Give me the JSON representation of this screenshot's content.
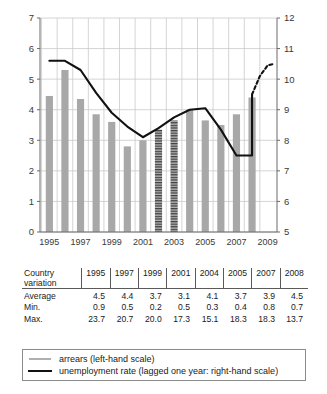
{
  "chart_data": {
    "type": "bar",
    "title": "",
    "subtitle": "",
    "xlabel": "",
    "ylabel": "",
    "grid": true,
    "legend_position": "below-table",
    "x": [
      1995,
      1996,
      1997,
      1998,
      1999,
      2000,
      2001,
      2002,
      2003,
      2004,
      2005,
      2006,
      2007,
      2008
    ],
    "categories": [
      "1995",
      "1996",
      "1997",
      "1998",
      "1999",
      "2000",
      "2001",
      "2002",
      "2003",
      "2004",
      "2005",
      "2006",
      "2007",
      "2008"
    ],
    "xtick_labels": [
      "1995",
      "1997",
      "1999",
      "2001",
      "2003",
      "2005",
      "2007",
      "2009"
    ],
    "xtick_values": [
      1995,
      1997,
      1999,
      2001,
      2003,
      2005,
      2007,
      2009
    ],
    "xlim": [
      1994.4,
      2009.6
    ],
    "left_axis": {
      "label": "arrears (left-hand scale)",
      "ylim": [
        0,
        7
      ],
      "ticks": [
        0,
        1,
        2,
        3,
        4,
        5,
        6,
        7
      ],
      "tick_labels": [
        "0",
        "1",
        "2",
        "3",
        "4",
        "5",
        "6",
        "7"
      ]
    },
    "right_axis": {
      "label": "unemployment rate (lagged one year: right-hand scale)",
      "ylim": [
        5,
        12
      ],
      "ticks": [
        5,
        6,
        7,
        8,
        9,
        10,
        11,
        12
      ],
      "tick_labels": [
        "5",
        "6",
        "7",
        "8",
        "9",
        "10",
        "11",
        "12"
      ]
    },
    "series": [
      {
        "name": "arrears",
        "type": "bar",
        "axis": "left",
        "color": "#a8a8a8",
        "hatched_color": "#555555",
        "x": [
          1995,
          1996,
          1997,
          1998,
          1999,
          2000,
          2001,
          2002,
          2003,
          2004,
          2005,
          2006,
          2007,
          2008
        ],
        "values": [
          4.45,
          5.3,
          4.35,
          3.85,
          3.6,
          2.8,
          3.0,
          3.35,
          3.65,
          4.0,
          3.65,
          3.5,
          3.85,
          4.4
        ],
        "hatched": [
          false,
          false,
          false,
          false,
          false,
          false,
          false,
          true,
          true,
          false,
          false,
          false,
          false,
          false
        ]
      },
      {
        "name": "unemployment rate (lagged one year)",
        "type": "line",
        "axis": "right",
        "color": "#111111",
        "solid_x": [
          1995,
          1996,
          1997,
          1998,
          1999,
          2000,
          2001,
          2002,
          2003,
          2004,
          2005,
          2006,
          2007,
          2008
        ],
        "solid_values": [
          10.6,
          10.6,
          10.3,
          9.55,
          8.9,
          8.45,
          8.1,
          8.4,
          8.75,
          9.0,
          9.05,
          8.35,
          7.5,
          7.5
        ],
        "dashed_x": [
          2008,
          2008.5,
          2009,
          2009.4
        ],
        "dashed_values": [
          9.5,
          10.1,
          10.45,
          10.5
        ],
        "rise_x": [
          2008
        ],
        "rise_values": [
          9.5
        ]
      }
    ]
  },
  "table": {
    "corner_label_line1": "Country",
    "corner_label_line2": "variation",
    "columns": [
      "1995",
      "1997",
      "1999",
      "2001",
      "2004",
      "2005",
      "2007",
      "2008"
    ],
    "rows": [
      {
        "label": "Average",
        "values": [
          "4.5",
          "4.4",
          "3.7",
          "3.1",
          "4.1",
          "3.7",
          "3.9",
          "4.5"
        ]
      },
      {
        "label": "Min.",
        "values": [
          "0.9",
          "0.5",
          "0.2",
          "0.5",
          "0.3",
          "0.4",
          "0.8",
          "0.7"
        ]
      },
      {
        "label": "Max.",
        "values": [
          "23.7",
          "20.7",
          "20.0",
          "17.3",
          "15.1",
          "18.3",
          "18.3",
          "13.7"
        ]
      }
    ]
  },
  "legend": {
    "items": [
      {
        "marker": "bar-swatch",
        "label": "arrears (left-hand scale)"
      },
      {
        "marker": "line-swatch",
        "label": "unemployment rate (lagged one year: right-hand scale)"
      }
    ]
  },
  "colors": {
    "bar_fill": "#a8a8a8",
    "bar_hatch": "#555555",
    "line": "#111111",
    "grid": "#c9c9c9",
    "axis": "#6a6a6a",
    "text": "#1a1a1a"
  }
}
